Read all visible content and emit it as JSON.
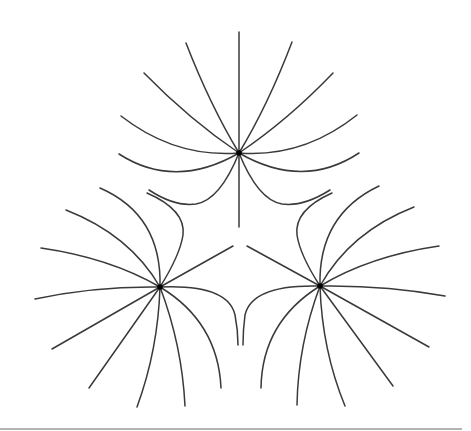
{
  "figure": {
    "line_color": "#3a3a3a",
    "charge_color": "#000000",
    "baseline_color": "#9a9a9a",
    "charges": [
      {
        "name": "top",
        "x": 239,
        "y": 153
      },
      {
        "name": "left",
        "x": 160,
        "y": 287
      },
      {
        "name": "right",
        "x": 320,
        "y": 286
      }
    ],
    "lines_per_charge": 12
  }
}
